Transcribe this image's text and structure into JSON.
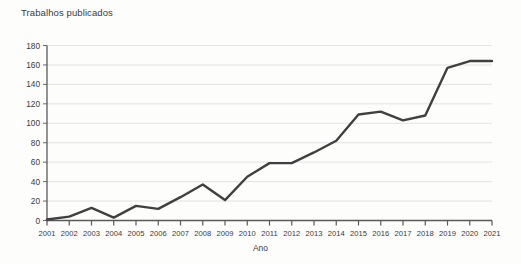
{
  "chart_data": {
    "type": "line",
    "title": "",
    "ylabel": "Trabalhos publicados",
    "xlabel": "Ano",
    "categories": [
      "2001",
      "2002",
      "2003",
      "2004",
      "2005",
      "2006",
      "2007",
      "2008",
      "2009",
      "2010",
      "2011",
      "2012",
      "2013",
      "2014",
      "2015",
      "2016",
      "2017",
      "2018",
      "2019",
      "2020",
      "2021"
    ],
    "values": [
      1,
      4,
      13,
      3,
      15,
      12,
      24,
      37,
      21,
      45,
      59,
      59,
      70,
      82,
      109,
      112,
      103,
      108,
      157,
      164,
      164
    ],
    "series": [
      {
        "name": "Trabalhos publicados",
        "values": [
          1,
          4,
          13,
          3,
          15,
          12,
          24,
          37,
          21,
          45,
          59,
          59,
          70,
          82,
          109,
          112,
          103,
          108,
          157,
          164,
          164
        ],
        "color": "#404040"
      }
    ],
    "ylim": [
      0,
      180
    ],
    "yticks": [
      0,
      20,
      40,
      60,
      80,
      100,
      120,
      140,
      160,
      180
    ],
    "ytick_labels": [
      "0",
      "20",
      "40",
      "60",
      "80",
      "100",
      "120",
      "140",
      "160",
      "180"
    ],
    "xtick_labels": [
      "2001",
      "2002",
      "2003",
      "2004",
      "2005",
      "2006",
      "2007",
      "2008",
      "2009",
      "2010",
      "2011",
      "2012",
      "2013",
      "2014",
      "2015",
      "2016",
      "2017",
      "2018",
      "2019",
      "2020",
      "2021"
    ],
    "grid": true,
    "grid_axis": "y",
    "legend": false,
    "legend_position": "none",
    "line_color": "#404040",
    "grid_color": "#d9d9d9",
    "axis_color": "#5a5a5a",
    "background_color": "#fdfdfc"
  }
}
